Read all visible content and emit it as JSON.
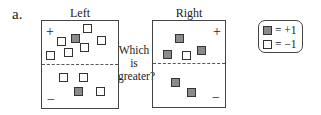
{
  "problem_label": "a.",
  "question": [
    "Which",
    "is",
    "greater?"
  ],
  "left": {
    "title": "Left",
    "plus_sign": "+",
    "minus_sign": "−",
    "tiles": [
      {
        "type": "neg",
        "x": 41,
        "y": 3
      },
      {
        "type": "pos",
        "x": 29,
        "y": 13
      },
      {
        "type": "neg",
        "x": 15,
        "y": 16
      },
      {
        "type": "neg",
        "x": 55,
        "y": 15
      },
      {
        "type": "neg",
        "x": 38,
        "y": 22
      },
      {
        "type": "neg",
        "x": 22,
        "y": 27
      },
      {
        "type": "neg",
        "x": 4,
        "y": 30
      },
      {
        "type": "neg",
        "x": 17,
        "y": 52
      },
      {
        "type": "neg",
        "x": 37,
        "y": 52
      },
      {
        "type": "pos",
        "x": 32,
        "y": 66
      },
      {
        "type": "neg",
        "x": 54,
        "y": 66
      }
    ]
  },
  "right": {
    "title": "Right",
    "plus_sign": "+",
    "minus_sign": "−",
    "tiles": [
      {
        "type": "pos",
        "x": 22,
        "y": 13
      },
      {
        "type": "pos",
        "x": 10,
        "y": 29
      },
      {
        "type": "neg",
        "x": 29,
        "y": 30
      },
      {
        "type": "pos",
        "x": 44,
        "y": 25
      },
      {
        "type": "pos",
        "x": 18,
        "y": 57
      },
      {
        "type": "pos",
        "x": 34,
        "y": 67
      }
    ]
  },
  "legend": {
    "items": [
      {
        "type": "pos",
        "label": "= +1"
      },
      {
        "type": "neg",
        "label": "= −1"
      }
    ]
  },
  "colors": {
    "positive_tile": "#8a8a8a",
    "negative_tile": "#ffffff",
    "border": "#444444"
  }
}
